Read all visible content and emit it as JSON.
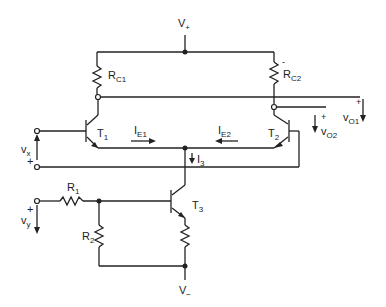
{
  "diagram": {
    "type": "circuit",
    "labels": {
      "v_plus": "V",
      "v_plus_sub": "+",
      "v_minus": "V",
      "v_minus_sub": "−",
      "rc1": "R",
      "rc1_sub": "C1",
      "rc2": "R",
      "rc2_sub": "C2",
      "t1": "T",
      "t1_sub": "1",
      "t2": "T",
      "t2_sub": "2",
      "t3": "T",
      "t3_sub": "3",
      "ie1": "I",
      "ie1_sub": "E1",
      "ie2": "I",
      "ie2_sub": "E2",
      "i3": "I",
      "i3_sub": "3",
      "r1": "R",
      "r1_sub": "1",
      "r2": "R",
      "r2_sub": "2",
      "vx": "v",
      "vx_sub": "x",
      "vy": "v",
      "vy_sub": "y",
      "vo1": "v",
      "vo1_sub": "O1",
      "vo2": "v",
      "vo2_sub": "O2",
      "plus": "+",
      "minus": "-"
    },
    "components": [
      "RC1",
      "RC2",
      "T1",
      "T2",
      "T3",
      "R1",
      "R2",
      "emitter resistor"
    ],
    "colors": {
      "line": "#222222",
      "background": "#ffffff"
    }
  }
}
